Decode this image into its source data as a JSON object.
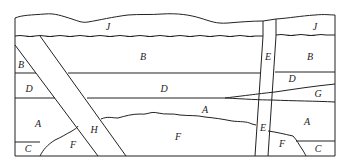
{
  "diagram": {
    "line_color": "#222222",
    "background": "#ffffff",
    "labels": [
      {
        "id": "J-left",
        "text": "J",
        "x": 108,
        "y": 27
      },
      {
        "id": "J-right",
        "text": "J",
        "x": 315,
        "y": 27
      },
      {
        "id": "B-main",
        "text": "B",
        "x": 143,
        "y": 57
      },
      {
        "id": "B-left",
        "text": "B",
        "x": 21,
        "y": 65
      },
      {
        "id": "B-right",
        "text": "B",
        "x": 310,
        "y": 57
      },
      {
        "id": "E-upper",
        "text": "E",
        "x": 268,
        "y": 57
      },
      {
        "id": "D-left",
        "text": "D",
        "x": 29,
        "y": 89
      },
      {
        "id": "D-main",
        "text": "D",
        "x": 164,
        "y": 89
      },
      {
        "id": "D-right",
        "text": "D",
        "x": 292,
        "y": 79
      },
      {
        "id": "G",
        "text": "G",
        "x": 318,
        "y": 94
      },
      {
        "id": "A-left",
        "text": "A",
        "x": 38,
        "y": 124
      },
      {
        "id": "A-main",
        "text": "A",
        "x": 205,
        "y": 110
      },
      {
        "id": "A-right",
        "text": "A",
        "x": 307,
        "y": 122
      },
      {
        "id": "H",
        "text": "H",
        "x": 94,
        "y": 130
      },
      {
        "id": "F-left",
        "text": "F",
        "x": 73,
        "y": 145
      },
      {
        "id": "F-main",
        "text": "F",
        "x": 178,
        "y": 137
      },
      {
        "id": "F-right",
        "text": "F",
        "x": 282,
        "y": 144
      },
      {
        "id": "E-lower",
        "text": "E",
        "x": 263,
        "y": 128
      },
      {
        "id": "C-left",
        "text": "C",
        "x": 28,
        "y": 149
      },
      {
        "id": "C-right",
        "text": "C",
        "x": 318,
        "y": 149
      }
    ]
  }
}
